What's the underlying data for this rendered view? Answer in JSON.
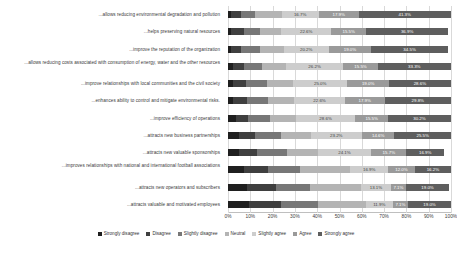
{
  "chart_data": {
    "type": "bar",
    "subtype": "stacked-horizontal-100-percent",
    "title": "",
    "xlabel": "",
    "ylabel": "",
    "xlim": [
      0,
      100
    ],
    "xticks": [
      "0%",
      "10%",
      "20%",
      "30%",
      "40%",
      "50%",
      "60%",
      "70%",
      "80%",
      "90%",
      "100%"
    ],
    "grid": true,
    "legend_position": "bottom",
    "legend": [
      {
        "name": "Strongly disagree",
        "color": "#1f1f1f"
      },
      {
        "name": "Disagree",
        "color": "#3f3f3f"
      },
      {
        "name": "Slightly disagree",
        "color": "#777777"
      },
      {
        "name": "Neutral",
        "color": "#b4b4b4"
      },
      {
        "name": "Slightly agree",
        "color": "#cdcdcd"
      },
      {
        "name": "Agree",
        "color": "#9a9a9a"
      },
      {
        "name": "Strongly agree",
        "color": "#5e5e5e"
      }
    ],
    "categories": [
      "...allows reducing environmental degradation and pollution",
      "...helps preserving natural resources",
      "...improve the reputation of the organization",
      "...allows reducing costs associated with consumption of energy, water and the other resources",
      "...improve relationships with local communities and the civil society",
      "...enhances ability to control and mitigate environmental risks.",
      "...improve efficiency of operations",
      "...attracts new business partnerships",
      "...attracts new valuable sponsorships",
      "...improves relationships with national and international football associations",
      "...attracts new operators and subscribers",
      "...attracts valuable and motivated employees"
    ],
    "series": [
      {
        "name": "Strongly disagree",
        "values": [
          1.2,
          1.2,
          1.2,
          2.4,
          2.4,
          2.4,
          3.6,
          4.8,
          4.8,
          7.2,
          8.3,
          9.5
        ]
      },
      {
        "name": "Disagree",
        "values": [
          4.8,
          6.0,
          4.8,
          4.8,
          6.0,
          6.0,
          6.0,
          7.2,
          8.4,
          10.8,
          13.1,
          14.3
        ]
      },
      {
        "name": "Slightly disagree",
        "values": [
          6.0,
          7.1,
          8.3,
          8.3,
          9.5,
          9.5,
          10.7,
          11.9,
          13.1,
          14.3,
          15.5,
          16.7
        ]
      },
      {
        "name": "Neutral",
        "values": [
          12.0,
          9.5,
          10.7,
          10.7,
          12.0,
          11.9,
          12.1,
          13.3,
          13.9,
          22.6,
          22.9,
          21.4
        ]
      },
      {
        "name": "Slightly agree",
        "values": [
          16.7,
          22.6,
          20.2,
          26.2,
          25.0,
          22.6,
          28.6,
          23.2,
          24.1,
          16.9,
          13.1,
          11.9
        ]
      },
      {
        "name": "Agree",
        "values": [
          17.9,
          15.5,
          19.0,
          15.5,
          19.0,
          17.9,
          15.5,
          14.6,
          15.7,
          12.0,
          7.1,
          7.1
        ]
      },
      {
        "name": "Strongly agree",
        "values": [
          41.3,
          36.9,
          34.5,
          33.3,
          28.6,
          29.8,
          30.2,
          25.5,
          16.9,
          16.2,
          19.0,
          19.0
        ]
      }
    ],
    "visible_value_labels": [
      {
        "row": 0,
        "labels": [
          {
            "series": "Slightly agree",
            "text": "16.7%"
          },
          {
            "series": "Agree",
            "text": "17.9%"
          },
          {
            "series": "Strongly agree",
            "text": "41.3%"
          }
        ]
      },
      {
        "row": 1,
        "labels": [
          {
            "series": "Slightly agree",
            "text": "22.6%"
          },
          {
            "series": "Agree",
            "text": "15.5%"
          },
          {
            "series": "Strongly agree",
            "text": "36.9%"
          }
        ]
      },
      {
        "row": 2,
        "labels": [
          {
            "series": "Slightly agree",
            "text": "20.2%"
          },
          {
            "series": "Agree",
            "text": "19.0%"
          },
          {
            "series": "Strongly agree",
            "text": "34.5%"
          }
        ]
      },
      {
        "row": 3,
        "labels": [
          {
            "series": "Slightly agree",
            "text": "26.2%"
          },
          {
            "series": "Agree",
            "text": "15.5%"
          },
          {
            "series": "Strongly agree",
            "text": "33.3%"
          }
        ]
      },
      {
        "row": 4,
        "labels": [
          {
            "series": "Slightly agree",
            "text": "25.0%"
          },
          {
            "series": "Agree",
            "text": "19.0%"
          },
          {
            "series": "Strongly agree",
            "text": "28.6%"
          }
        ]
      },
      {
        "row": 5,
        "labels": [
          {
            "series": "Slightly agree",
            "text": "22.6%"
          },
          {
            "series": "Agree",
            "text": "17.9%"
          },
          {
            "series": "Strongly agree",
            "text": "29.8%"
          }
        ]
      },
      {
        "row": 6,
        "labels": [
          {
            "series": "Slightly agree",
            "text": "28.6%"
          },
          {
            "series": "Agree",
            "text": "15.5%"
          },
          {
            "series": "Strongly agree",
            "text": "30.2%"
          }
        ]
      },
      {
        "row": 7,
        "labels": [
          {
            "series": "Slightly agree",
            "text": "23.2%"
          },
          {
            "series": "Agree",
            "text": "14.6%"
          },
          {
            "series": "Strongly agree",
            "text": "25.5%"
          }
        ]
      },
      {
        "row": 8,
        "labels": [
          {
            "series": "Slightly agree",
            "text": "24.1%"
          },
          {
            "series": "Agree",
            "text": "15.7%"
          },
          {
            "series": "Strongly agree",
            "text": "16.9%"
          }
        ]
      },
      {
        "row": 9,
        "labels": [
          {
            "series": "Slightly agree",
            "text": "16.9%"
          },
          {
            "series": "Agree",
            "text": "12.0%"
          },
          {
            "series": "Strongly agree",
            "text": "16.2%"
          }
        ]
      },
      {
        "row": 10,
        "labels": [
          {
            "series": "Slightly agree",
            "text": "13.1%"
          },
          {
            "series": "Agree",
            "text": "7.1%"
          },
          {
            "series": "Strongly agree",
            "text": "19.0%"
          }
        ]
      },
      {
        "row": 11,
        "labels": [
          {
            "series": "Slightly agree",
            "text": "11.9%"
          },
          {
            "series": "Agree",
            "text": "7.1%"
          },
          {
            "series": "Strongly agree",
            "text": "19.0%"
          }
        ]
      }
    ]
  }
}
